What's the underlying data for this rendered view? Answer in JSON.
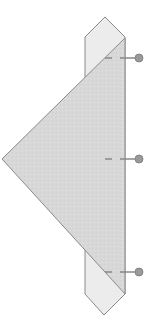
{
  "diagram": {
    "type": "fold-step",
    "colors": {
      "background": "#ffffff",
      "strip_fill": "#ececec",
      "triangle_fill": "#d9d9d9",
      "outline": "#8a8a8a",
      "marker": "#9a9a9a"
    },
    "markers": [
      {
        "label": "top-marker",
        "y": 58
      },
      {
        "label": "middle-marker",
        "y": 159
      },
      {
        "label": "bottom-marker",
        "y": 272
      }
    ]
  }
}
